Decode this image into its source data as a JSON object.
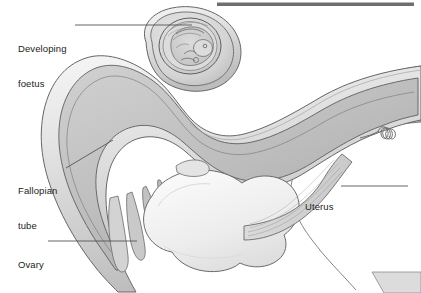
{
  "figure": {
    "background_color": "#ffffff",
    "label_color": "#222222",
    "leader_line_color": "#555555",
    "outline_color": "#5a5a5a",
    "top_bar_color": "#6e6e6e"
  },
  "labels": {
    "foetus": {
      "line1": "Developing",
      "line2": "foetus"
    },
    "fallopian": {
      "line1": "Fallopian",
      "line2": "tube"
    },
    "ovary": {
      "line1": "Ovary"
    },
    "uterus": {
      "line1": "Uterus"
    }
  },
  "anatomy": {
    "parts": [
      "developing-foetus",
      "amniotic-sac",
      "fallopian-tube",
      "fimbriae",
      "ovary",
      "uterus",
      "uterine-wall",
      "coiled-vessel"
    ],
    "fill_light": "#f2f2f2",
    "fill_mid": "#d8d8d8",
    "fill_dark": "#b8b8b8",
    "fill_ovary": "#ececec"
  }
}
